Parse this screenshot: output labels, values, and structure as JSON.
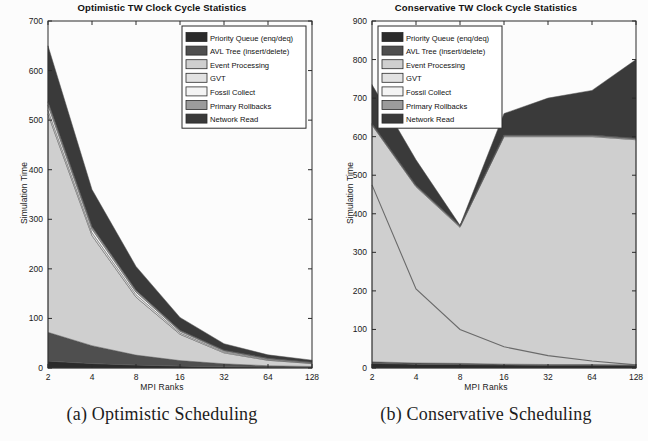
{
  "figure": {
    "captions": [
      {
        "id": "a",
        "text": "(a) Optimistic Scheduling"
      },
      {
        "id": "b",
        "text": "(b) Conservative Scheduling"
      }
    ]
  },
  "legend_series": [
    {
      "name": "Priority Queue (enq/deq)",
      "color": "#2b2b2b"
    },
    {
      "name": "AVL Tree (insert/delete)",
      "color": "#4f4f4f"
    },
    {
      "name": "Event Processing",
      "color": "#cfcfcf"
    },
    {
      "name": "GVT",
      "color": "#e2e2e2"
    },
    {
      "name": "Fossil Collect",
      "color": "#f4f4f4"
    },
    {
      "name": "Primary Rollbacks",
      "color": "#9b9b9b"
    },
    {
      "name": "Network Read",
      "color": "#3a3a3a"
    }
  ],
  "chart_data": [
    {
      "type": "area",
      "id": "optimistic",
      "title": "Optimistic TW Clock Cycle Statistics",
      "xlabel": "MPI Ranks",
      "ylabel": "Simulation Time",
      "xscale": "log2",
      "categories": [
        2,
        4,
        8,
        16,
        32,
        64,
        128
      ],
      "xticklabels": [
        "2",
        "4",
        "8",
        "16",
        "32",
        "64",
        "128"
      ],
      "ylim": [
        0,
        700
      ],
      "yticks": [
        0,
        100,
        200,
        300,
        400,
        500,
        600,
        700
      ],
      "grid": false,
      "legend_position": "upper right",
      "stacked": true,
      "series": [
        {
          "name": "Priority Queue (enq/deq)",
          "color": "#2b2b2b",
          "values": [
            14,
            9,
            6,
            4,
            2.5,
            1.5,
            1
          ]
        },
        {
          "name": "AVL Tree (insert/delete)",
          "color": "#4f4f4f",
          "values": [
            58,
            36,
            20,
            11,
            6,
            3,
            2
          ]
        },
        {
          "name": "Event Processing",
          "color": "#cfcfcf",
          "values": [
            440,
            222,
            117,
            53,
            22,
            11,
            6
          ]
        },
        {
          "name": "GVT",
          "color": "#e2e2e2",
          "values": [
            8,
            6,
            5,
            3,
            2,
            1.5,
            1
          ]
        },
        {
          "name": "Fossil Collect",
          "color": "#f4f4f4",
          "values": [
            10,
            7,
            5,
            3,
            2,
            1.5,
            1
          ]
        },
        {
          "name": "Primary Rollbacks",
          "color": "#9b9b9b",
          "values": [
            7,
            5,
            4,
            2,
            1.5,
            1,
            0.8
          ]
        },
        {
          "name": "Network Read",
          "color": "#3a3a3a",
          "values": [
            113,
            75,
            48,
            26,
            13,
            7,
            4
          ]
        }
      ],
      "totals": [
        650,
        360,
        205,
        102,
        49,
        26.5,
        15.8
      ]
    },
    {
      "type": "area",
      "id": "conservative",
      "title": "Conservative TW Clock Cycle Statistics",
      "xlabel": "MPI Ranks",
      "ylabel": "Simulation Time",
      "xscale": "log2",
      "categories": [
        2,
        4,
        8,
        16,
        32,
        64,
        128
      ],
      "xticklabels": [
        "2",
        "4",
        "8",
        "16",
        "32",
        "64",
        "128"
      ],
      "ylim": [
        0,
        900
      ],
      "yticks": [
        0,
        100,
        200,
        300,
        400,
        500,
        600,
        700,
        800,
        900
      ],
      "grid": false,
      "legend_position": "upper left",
      "stacked": true,
      "series": [
        {
          "name": "Priority Queue (enq/deq)",
          "color": "#2b2b2b",
          "values": [
            12,
            10,
            9,
            8,
            7,
            7,
            6
          ]
        },
        {
          "name": "AVL Tree (insert/delete)",
          "color": "#4f4f4f",
          "values": [
            4,
            3,
            3,
            2,
            2,
            2,
            2
          ]
        },
        {
          "name": "Event Processing",
          "color": "#cfcfcf",
          "values": [
            614,
            457,
            353,
            590,
            591,
            591,
            584
          ]
        },
        {
          "name": "GVT",
          "color": "#e2e2e2",
          "values": [
            2,
            2,
            2,
            2,
            2,
            2,
            2
          ]
        },
        {
          "name": "Fossil Collect",
          "color": "#f4f4f4",
          "values": [
            1,
            1,
            1,
            1,
            1,
            1,
            1
          ]
        },
        {
          "name": "Primary Rollbacks",
          "color": "#9b9b9b",
          "values": [
            1,
            1,
            1,
            1,
            1,
            1,
            1
          ]
        },
        {
          "name": "Network Read",
          "color": "#3a3a3a",
          "values": [
            101,
            66,
            1,
            56,
            96,
            116,
            204
          ]
        }
      ],
      "totals": [
        735,
        540,
        370,
        660,
        700,
        720,
        800
      ],
      "inner_line": {
        "name": "Event Processing inner boundary",
        "values": [
          475,
          205,
          100,
          55,
          32,
          18,
          8
        ]
      }
    }
  ]
}
